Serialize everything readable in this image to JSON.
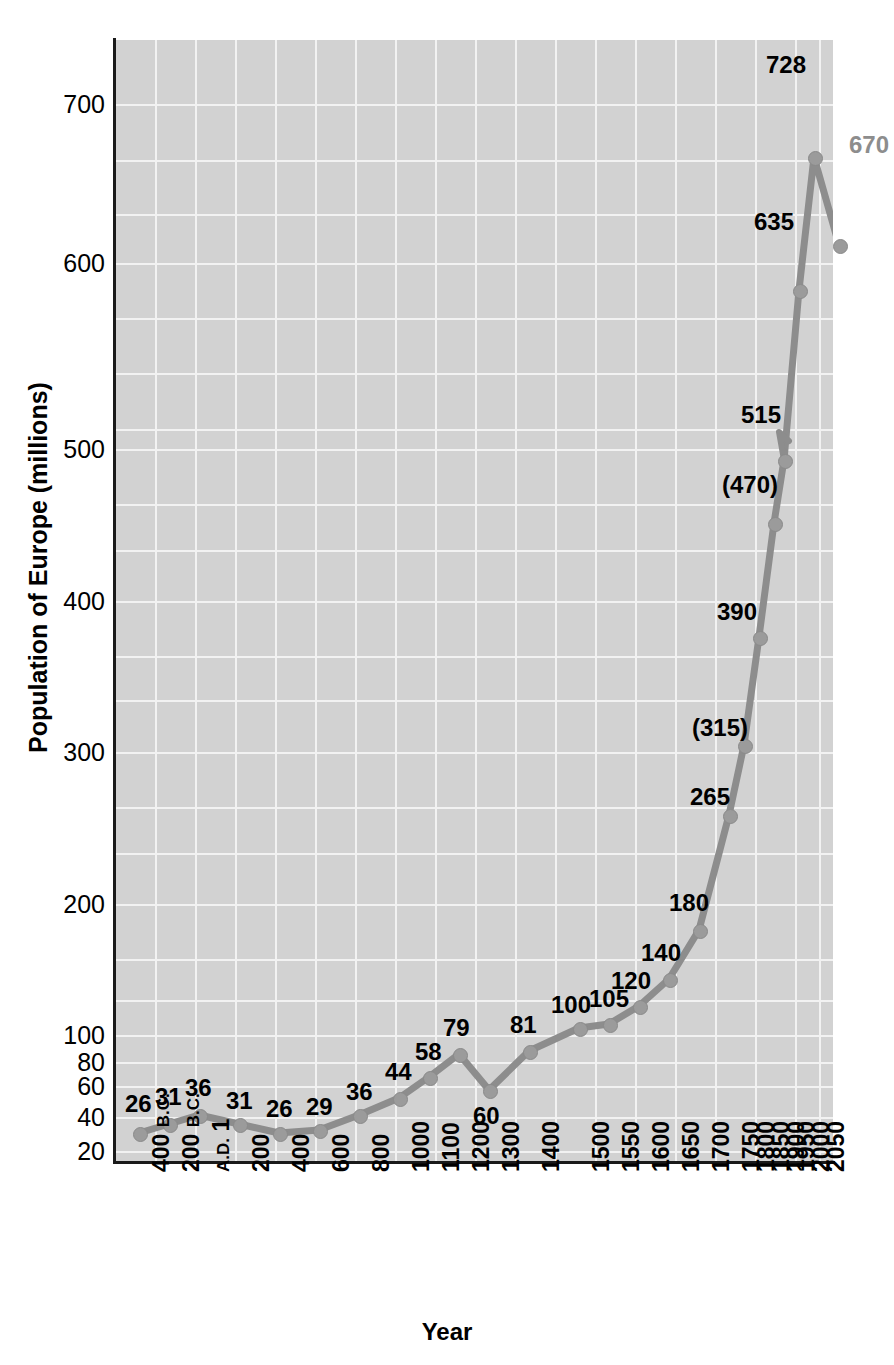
{
  "chart_data": {
    "type": "line",
    "title": "",
    "xlabel": "Year",
    "ylabel": "Population of Europe (millions)",
    "x_tick_labels": [
      "400 B.C.",
      "200 B.C.",
      "A.D. 1",
      "200",
      "400",
      "600",
      "800",
      "1000",
      "1100",
      "1200",
      "1300",
      "1400",
      "1500",
      "1550",
      "1600",
      "1650",
      "1700",
      "1750",
      "1800",
      "1850",
      "1900",
      "1950",
      "2000",
      "2050"
    ],
    "y_tick_labels": [
      "20",
      "40",
      "60",
      "80",
      "100",
      "200",
      "300",
      "400",
      "500",
      "600",
      "700"
    ],
    "y_tick_values": [
      20,
      40,
      60,
      80,
      100,
      200,
      300,
      400,
      500,
      600,
      700
    ],
    "ylim": [
      15,
      745
    ],
    "axis_note": "y-axis is compressed below 100 and linear above",
    "grid": true,
    "legend": null,
    "series": [
      {
        "name": "Population of Europe (millions)",
        "categories": [
          "400 B.C.",
          "200 B.C.",
          "A.D. 1",
          "200",
          "400",
          "600",
          "800",
          "1000",
          "1100",
          "1200",
          "1300",
          "1400",
          "1500",
          "1550",
          "1600",
          "1650",
          "1700",
          "1750",
          "1800",
          "1850",
          "1900",
          "1950",
          "2000",
          "2050"
        ],
        "values": [
          26,
          31,
          36,
          31,
          26,
          29,
          36,
          44,
          58,
          79,
          60,
          81,
          100,
          105,
          120,
          140,
          180,
          265,
          315,
          390,
          470,
          515,
          635,
          728,
          670
        ]
      }
    ],
    "points": [
      {
        "label": "26",
        "year": "400 B.C.",
        "value": 26,
        "px": 139,
        "py": 1133,
        "lx": 125,
        "ly": 1092,
        "estimated": false,
        "projected": false
      },
      {
        "label": "31",
        "year": "200 B.C.",
        "value": 31,
        "px": 169,
        "py": 1124,
        "lx": 155,
        "ly": 1085,
        "estimated": false,
        "projected": false
      },
      {
        "label": "36",
        "year": "A.D. 1",
        "value": 36,
        "px": 199,
        "py": 1115,
        "lx": 185,
        "ly": 1076,
        "estimated": false,
        "projected": false
      },
      {
        "label": "31",
        "year": "200",
        "value": 31,
        "px": 239,
        "py": 1124,
        "lx": 226,
        "ly": 1089,
        "estimated": false,
        "projected": false
      },
      {
        "label": "26",
        "year": "400",
        "value": 26,
        "px": 279,
        "py": 1133,
        "lx": 266,
        "ly": 1097,
        "estimated": false,
        "projected": false
      },
      {
        "label": "29",
        "year": "600",
        "value": 29,
        "px": 319,
        "py": 1130,
        "lx": 306,
        "ly": 1095,
        "estimated": false,
        "projected": false
      },
      {
        "label": "36",
        "year": "800",
        "value": 36,
        "px": 359,
        "py": 1115,
        "lx": 346,
        "ly": 1080,
        "estimated": false,
        "projected": false
      },
      {
        "label": "44",
        "year": "1000",
        "value": 44,
        "px": 399,
        "py": 1098,
        "lx": 385,
        "ly": 1060,
        "estimated": false,
        "projected": false
      },
      {
        "label": "58",
        "year": "1100",
        "value": 58,
        "px": 429,
        "py": 1077,
        "lx": 415,
        "ly": 1040,
        "estimated": false,
        "projected": false
      },
      {
        "label": "79",
        "year": "1200",
        "value": 79,
        "px": 459,
        "py": 1054,
        "lx": 443,
        "ly": 1016,
        "estimated": false,
        "projected": false
      },
      {
        "label": "60",
        "year": "1300",
        "value": 60,
        "px": 489,
        "py": 1090,
        "lx": 473,
        "ly": 1104,
        "estimated": false,
        "projected": false
      },
      {
        "label": "81",
        "year": "1400",
        "value": 81,
        "px": 529,
        "py": 1051,
        "lx": 510,
        "ly": 1013,
        "estimated": false,
        "projected": false
      },
      {
        "label": "100",
        "year": "1500",
        "value": 100,
        "px": 579,
        "py": 1028,
        "lx": 551,
        "ly": 993,
        "estimated": false,
        "projected": false
      },
      {
        "label": "105",
        "year": "1550",
        "value": 105,
        "px": 609,
        "py": 1024,
        "lx": 589,
        "ly": 987,
        "estimated": false,
        "projected": false
      },
      {
        "label": "120",
        "year": "1600",
        "value": 120,
        "px": 639,
        "py": 1006,
        "lx": 611,
        "ly": 969,
        "estimated": false,
        "projected": false
      },
      {
        "label": "140",
        "year": "1650",
        "value": 140,
        "px": 669,
        "py": 979,
        "lx": 641,
        "ly": 941,
        "estimated": false,
        "projected": false
      },
      {
        "label": "180",
        "year": "1700",
        "value": 180,
        "px": 699,
        "py": 930,
        "lx": 669,
        "ly": 891,
        "estimated": false,
        "projected": false
      },
      {
        "label": "265",
        "year": "1750",
        "value": 265,
        "px": 729,
        "py": 815,
        "lx": 690,
        "ly": 785,
        "estimated": false,
        "projected": false
      },
      {
        "label": "(315)",
        "year": "1800",
        "value": 315,
        "px": 744,
        "py": 745,
        "lx": 692,
        "ly": 716,
        "estimated": true,
        "projected": false
      },
      {
        "label": "390",
        "year": "1850",
        "value": 390,
        "px": 759,
        "py": 637,
        "lx": 717,
        "ly": 600,
        "estimated": false,
        "projected": false
      },
      {
        "label": "(470)",
        "year": "1900",
        "value": 470,
        "px": 774,
        "py": 523,
        "lx": 722,
        "ly": 473,
        "estimated": true,
        "projected": false
      },
      {
        "label": "515",
        "year": "1950",
        "value": 515,
        "px": 784,
        "py": 460,
        "lx": 741,
        "ly": 403,
        "estimated": false,
        "projected": false
      },
      {
        "label": "635",
        "year": "2000",
        "value": 635,
        "px": 799,
        "py": 290,
        "lx": 754,
        "ly": 210,
        "estimated": false,
        "projected": false
      },
      {
        "label": "728",
        "year": "2050",
        "value": 728,
        "px": 814,
        "py": 157,
        "lx": 766,
        "ly": 53,
        "estimated": false,
        "projected": false
      },
      {
        "label": "670",
        "year": "",
        "value": 670,
        "px": 839,
        "py": 245,
        "lx": 849,
        "ly": 133,
        "estimated": false,
        "projected": true
      }
    ],
    "line_color": "#8d8d8d",
    "marker_color": "#9b9b9b",
    "plot_background": "#d2d2d2",
    "gridline_color": "#f2f2f2",
    "axis_color": "#1a1a1a"
  },
  "axis_titles": {
    "y": "Population of Europe (millions)",
    "x": "Year"
  }
}
